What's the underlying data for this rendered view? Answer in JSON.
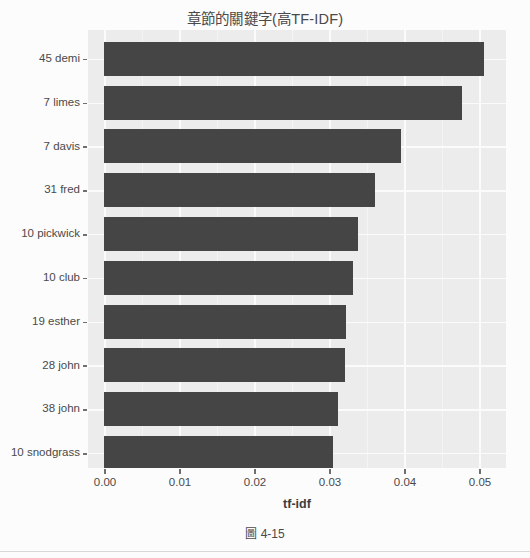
{
  "figure": {
    "caption": "圖 4-15"
  },
  "chart_data": {
    "type": "bar",
    "orientation": "horizontal",
    "title": "章節的關鍵字(高TF-IDF)",
    "xlabel": "tf-idf",
    "ylabel": "",
    "categories": [
      "45 demi",
      "7 limes",
      "7 davis",
      "31 fred",
      "10 pickwick",
      "10 club",
      "19 esther",
      "28 john",
      "38 john",
      "10 snodgrass"
    ],
    "values": [
      0.0527,
      0.0496,
      0.0411,
      0.0375,
      0.0352,
      0.0345,
      0.0335,
      0.0334,
      0.0324,
      0.0317
    ],
    "xlim": [
      0.0,
      0.0557
    ],
    "xticks": [
      0.0,
      0.01,
      0.02,
      0.03,
      0.04,
      0.05
    ],
    "xticklabels": [
      "0.00",
      "0.01",
      "0.02",
      "0.03",
      "0.04",
      "0.05"
    ],
    "grid": true,
    "legend": null,
    "bar_color": "#454545",
    "plot_background": "#ececec",
    "gridline_color": "#fbfbfb"
  }
}
